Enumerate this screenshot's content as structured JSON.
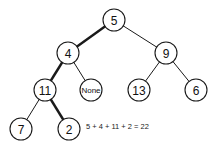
{
  "diagram": {
    "type": "binary-tree",
    "nodes": [
      {
        "id": "n5",
        "label": "5",
        "x": 114,
        "y": 20
      },
      {
        "id": "n4",
        "label": "4",
        "x": 68,
        "y": 53
      },
      {
        "id": "n9",
        "label": "9",
        "x": 166,
        "y": 53
      },
      {
        "id": "n11",
        "label": "11",
        "x": 45,
        "y": 90
      },
      {
        "id": "nNone",
        "label": "None",
        "x": 91,
        "y": 90
      },
      {
        "id": "n13",
        "label": "13",
        "x": 139,
        "y": 90
      },
      {
        "id": "n6",
        "label": "6",
        "x": 196,
        "y": 90
      },
      {
        "id": "n7",
        "label": "7",
        "x": 21,
        "y": 129
      },
      {
        "id": "n2",
        "label": "2",
        "x": 69,
        "y": 129
      }
    ],
    "edges": [
      {
        "from": "n5",
        "to": "n4",
        "highlighted": true
      },
      {
        "from": "n5",
        "to": "n9",
        "highlighted": false
      },
      {
        "from": "n4",
        "to": "n11",
        "highlighted": true
      },
      {
        "from": "n4",
        "to": "nNone",
        "highlighted": false
      },
      {
        "from": "n9",
        "to": "n13",
        "highlighted": false
      },
      {
        "from": "n9",
        "to": "n6",
        "highlighted": false
      },
      {
        "from": "n11",
        "to": "n7",
        "highlighted": false
      },
      {
        "from": "n11",
        "to": "n2",
        "highlighted": true
      }
    ],
    "highlighted_path": [
      "5",
      "4",
      "11",
      "2"
    ],
    "equation": "5 + 4 + 11 + 2 = 22"
  }
}
